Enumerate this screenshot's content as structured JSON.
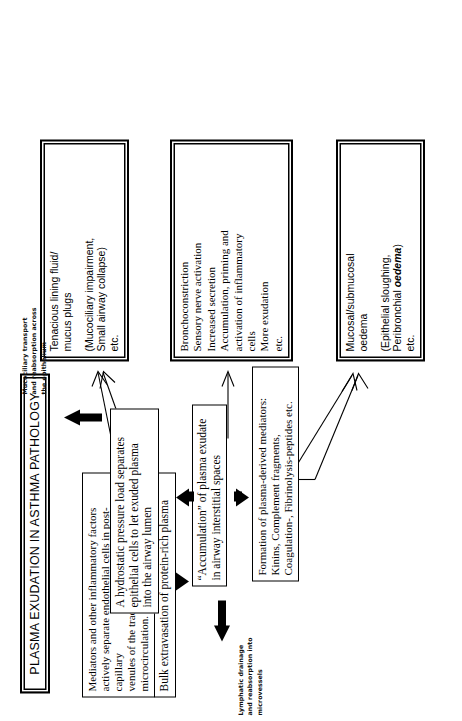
{
  "figure": {
    "title": "PLASMA EXUDATION IN ASTHMA PATHOLOGY",
    "orientation_note": "rotated-90-ccw"
  },
  "nodes": {
    "mediators": {
      "line1": "Mediators and other inflammatory factors",
      "line2": "actively separate endothelial cells in post-capillary",
      "line3": "venules of the tracheobronchial microcirculation."
    },
    "extravasation": {
      "text": "Bulk extravasation of protein-rich plasma"
    },
    "accumulation": {
      "line1": "“Accumulation” of plasma exudate",
      "line2": "in airway interstitial spaces"
    },
    "hydrostatic": {
      "line1": "A hydrostatic pressure load separates",
      "line2": "epithelial cells to let exuded plasma",
      "line3": "into the airway lumen"
    },
    "plasma_mediators": {
      "line1": "Formation of plasma-derived mediators:",
      "line2": "Kinins, Complement fragments,",
      "line3": "Coagulation-, Fibrinolysis-peptides etc."
    }
  },
  "outcomes": {
    "tenacious": {
      "main_line1": "Tenacious lining fluid/",
      "main_line2": "mucus plugs",
      "sub_line1": "(Mucociliary impairment,",
      "sub_line2": "Small airway collapse)",
      "sub_line3": "etc."
    },
    "bronchoconstriction": {
      "line1": "Bronchoconstriction",
      "line2": "Sensory nerve activation",
      "line3": "Increased secretion",
      "line4": "Accumulation, priming and",
      "line5": "activation of inflammatory",
      "line6": "cells",
      "line7": "More exudation",
      "line8": "etc."
    },
    "oedema": {
      "main_line1": "Mucosal/submucosal",
      "main_line2": "oedema",
      "sub_line1": "(Epithelial sloughing,",
      "sub_line2_pre": "Peribronchial ",
      "sub_line2_em": "oedema",
      "sub_line2_post": ")",
      "sub_line3": "etc."
    }
  },
  "annotations": {
    "mucociliary": {
      "line1": "Mucociliary transport",
      "line2": "and reabsorption across",
      "line3": "the epithelium"
    },
    "lymphatic": {
      "line1": "Lymphatic drainage",
      "line2": "and reabsorption into",
      "line3": "microvessels"
    }
  },
  "colors": {
    "ink": "#000000",
    "paper": "#ffffff"
  }
}
